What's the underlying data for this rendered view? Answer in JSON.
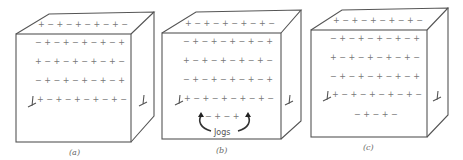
{
  "figure": {
    "panels": [
      {
        "id": "a",
        "caption": "(a)",
        "rows": [
          "+ − + − + − + − + −",
          "− + − + − + − + − +",
          "+ − + − + − + − + −",
          "− + − + − + − + − +",
          "+ − + − + − + − + −"
        ],
        "extra_rows": []
      },
      {
        "id": "b",
        "caption": "(b)",
        "rows": [
          "+ − + − + − + − + −",
          "− + − + − + − + − +",
          "+ − + − + − + − + −",
          "− + − + − + − + − +",
          "+ − + − + − + − + −"
        ],
        "extra_rows": [
          "− + − +"
        ],
        "annotation": "Jogs"
      },
      {
        "id": "c",
        "caption": "(c)",
        "rows": [
          "+ − + − + − + − + −",
          "− + − + − + − + − +",
          "+ − + − + − + − + −",
          "− + − + − + − + − +",
          "+ − + − + − + − + −"
        ],
        "extra_rows": [
          "− + − + −"
        ]
      }
    ],
    "dislocation_symbol": "⊥ (edge dislocation, drawn inclined)"
  }
}
